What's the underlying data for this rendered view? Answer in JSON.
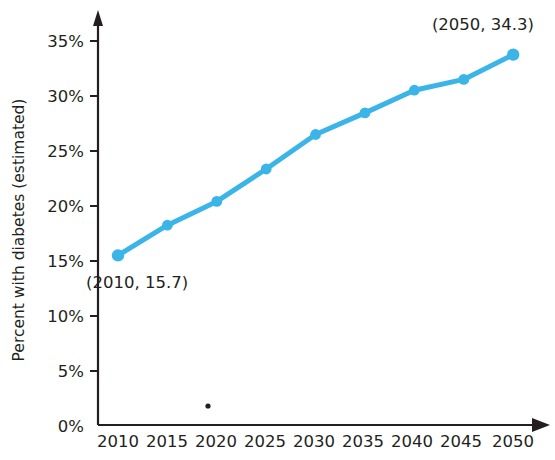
{
  "chart_data": {
    "type": "line",
    "title": "",
    "xlabel": "",
    "ylabel": "Percent with diabetes (estimated)",
    "x": [
      2010,
      2015,
      2020,
      2025,
      2030,
      2035,
      2040,
      2045,
      2050
    ],
    "values": [
      15.7,
      18.5,
      20.7,
      23.7,
      26.9,
      28.9,
      31.0,
      32.0,
      34.3
    ],
    "xticklabels": [
      "2010",
      "2015",
      "2020",
      "2025",
      "2030",
      "2035",
      "2040",
      "2045",
      "2050"
    ],
    "yticklabels": [
      "0%",
      "5%",
      "10%",
      "15%",
      "20%",
      "25%",
      "30%",
      "35%"
    ],
    "yticks": [
      0,
      5,
      10,
      15,
      20,
      25,
      30,
      35
    ],
    "ylim": [
      0,
      36.5
    ],
    "xlim": [
      2008,
      2052
    ],
    "grid": false,
    "legend": null,
    "series_color": "#3BB4E8",
    "axis_color": "#231f20",
    "annotations": [
      {
        "text": "(2010, 15.7)",
        "x": 2010,
        "y": 15.7,
        "position": "below-right"
      },
      {
        "text": "(2050, 34.3)",
        "x": 2050,
        "y": 34.3,
        "position": "above-left"
      }
    ]
  },
  "figure": {
    "y_axis_label": "Percent with diabetes (estimated)",
    "y_tick_labels": [
      "35%",
      "30%",
      "25%",
      "20%",
      "15%",
      "10%",
      "5%",
      "0%"
    ],
    "x_tick_labels": [
      "2010",
      "2015",
      "2020",
      "2025",
      "2030",
      "2035",
      "2040",
      "2045",
      "2050"
    ],
    "annotation_start": "(2010, 15.7)",
    "annotation_end": "(2050, 34.3)",
    "colors": {
      "series": "#3BB4E8",
      "axis": "#231f20",
      "text": "#231f20",
      "background": "#ffffff"
    }
  }
}
